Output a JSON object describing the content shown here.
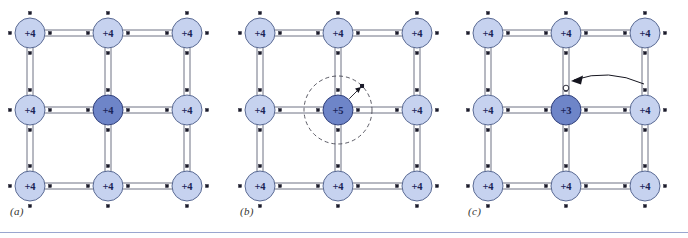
{
  "figure": {
    "rule_color": "#9aa6cf",
    "background": "#ffffff"
  },
  "colors": {
    "atom_light_fill": "#c6d2ef",
    "atom_light_stroke": "#5a6a93",
    "atom_dark_fill": "#6e85c8",
    "atom_dark_stroke": "#31407a",
    "bond_line": "#5d6377",
    "electron_dot": "#1b1b2a",
    "hole_fill": "#ffffff",
    "hole_stroke": "#1b1b2a",
    "orbit_dash": "#4a4a55",
    "arrow": "#15151f",
    "label_text": "#33342f",
    "atom_text": "#1a2457"
  },
  "geometry": {
    "atom_radius": 15,
    "grid_x": [
      30,
      108,
      187
    ],
    "grid_y": [
      33,
      110,
      186
    ],
    "bond_halfwidth": 3.0,
    "stub_length": 14,
    "electron_dot_size": 3.0
  },
  "panels": [
    {
      "id": "a",
      "label": "(a)",
      "caption_label": "(a)",
      "name": "intrinsic-silicon-lattice",
      "description": "Intrinsic silicon: every atom is a +4 silicon core, all bonds complete.",
      "atoms": [
        {
          "row": 0,
          "col": 0,
          "charge": "+4",
          "type": "light"
        },
        {
          "row": 0,
          "col": 1,
          "charge": "+4",
          "type": "light"
        },
        {
          "row": 0,
          "col": 2,
          "charge": "+4",
          "type": "light"
        },
        {
          "row": 1,
          "col": 0,
          "charge": "+4",
          "type": "light"
        },
        {
          "row": 1,
          "col": 1,
          "charge": "+4",
          "type": "dark"
        },
        {
          "row": 1,
          "col": 2,
          "charge": "+4",
          "type": "light"
        },
        {
          "row": 2,
          "col": 0,
          "charge": "+4",
          "type": "light"
        },
        {
          "row": 2,
          "col": 1,
          "charge": "+4",
          "type": "light"
        },
        {
          "row": 2,
          "col": 2,
          "charge": "+4",
          "type": "light"
        }
      ],
      "orbit": null,
      "hole": null,
      "curved_arrow": null
    },
    {
      "id": "b",
      "label": "(b)",
      "caption_label": "(b)",
      "name": "n-type-donor-lattice",
      "description": "N-type doping: a +5 pentavalent donor atom at the centre contributes a loosely bound fifth electron shown orbiting on a dashed circle.",
      "atoms": [
        {
          "row": 0,
          "col": 0,
          "charge": "+4",
          "type": "light"
        },
        {
          "row": 0,
          "col": 1,
          "charge": "+4",
          "type": "light"
        },
        {
          "row": 0,
          "col": 2,
          "charge": "+4",
          "type": "light"
        },
        {
          "row": 1,
          "col": 0,
          "charge": "+4",
          "type": "light"
        },
        {
          "row": 1,
          "col": 1,
          "charge": "+5",
          "type": "dark"
        },
        {
          "row": 1,
          "col": 2,
          "charge": "+4",
          "type": "light"
        },
        {
          "row": 2,
          "col": 0,
          "charge": "+4",
          "type": "light"
        },
        {
          "row": 2,
          "col": 1,
          "charge": "+4",
          "type": "light"
        },
        {
          "row": 2,
          "col": 2,
          "charge": "+4",
          "type": "light"
        }
      ],
      "orbit": {
        "cx": 108,
        "cy": 110,
        "r": 34,
        "dash": "4 3",
        "radius_angle_deg": -45
      },
      "hole": null,
      "curved_arrow": null
    },
    {
      "id": "c",
      "label": "(c)",
      "caption_label": "(c)",
      "name": "p-type-acceptor-lattice",
      "description": "P-type doping: a +3 trivalent acceptor atom at the centre leaves an unfilled bond, a hole, indicated by the open circle and incoming curved arrow.",
      "atoms": [
        {
          "row": 0,
          "col": 0,
          "charge": "+4",
          "type": "light"
        },
        {
          "row": 0,
          "col": 1,
          "charge": "+4",
          "type": "light"
        },
        {
          "row": 0,
          "col": 2,
          "charge": "+4",
          "type": "light"
        },
        {
          "row": 1,
          "col": 0,
          "charge": "+4",
          "type": "light"
        },
        {
          "row": 1,
          "col": 1,
          "charge": "+3",
          "type": "dark"
        },
        {
          "row": 1,
          "col": 2,
          "charge": "+4",
          "type": "light"
        },
        {
          "row": 2,
          "col": 0,
          "charge": "+4",
          "type": "light"
        },
        {
          "row": 2,
          "col": 1,
          "charge": "+4",
          "type": "light"
        },
        {
          "row": 2,
          "col": 2,
          "charge": "+4",
          "type": "light"
        }
      ],
      "orbit": null,
      "hole": {
        "cx": 108,
        "cy": 88,
        "r": 2.8
      },
      "curved_arrow": {
        "x1": 186,
        "y1": 84,
        "cx": 150,
        "cy": 68,
        "x2": 116,
        "y2": 80
      }
    }
  ]
}
